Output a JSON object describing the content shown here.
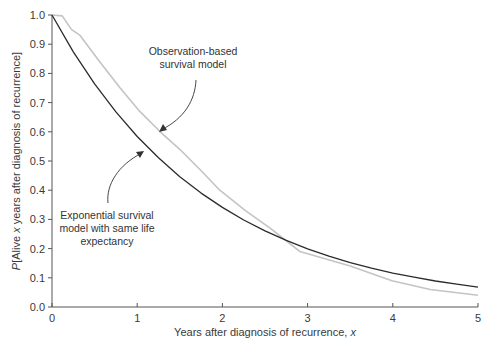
{
  "chart_data": {
    "type": "line",
    "title": "",
    "xlabel": "Years after diagnosis of recurrence, x",
    "ylabel": "P[Alive x years after diagnosis of recurrence]",
    "xlim": [
      0,
      5
    ],
    "ylim": [
      0,
      1.0
    ],
    "xticks": [
      "0",
      "1",
      "2",
      "3",
      "4",
      "5"
    ],
    "yticks": [
      "0.0",
      "0.1",
      "0.2",
      "0.3",
      "0.4",
      "0.5",
      "0.6",
      "0.7",
      "0.8",
      "0.9",
      "1.0"
    ],
    "grid": false,
    "legend": null,
    "series": [
      {
        "name": "Observation-based survival model",
        "color": "#c4c4c4",
        "x": [
          0,
          0.12,
          0.23,
          0.33,
          0.56,
          0.8,
          1.03,
          1.27,
          1.5,
          1.74,
          1.97,
          2.27,
          2.56,
          2.91,
          3.5,
          3.99,
          4.44,
          5.0
        ],
        "y": [
          1.0,
          0.997,
          0.95,
          0.93,
          0.84,
          0.75,
          0.67,
          0.6,
          0.54,
          0.47,
          0.4,
          0.33,
          0.27,
          0.19,
          0.14,
          0.09,
          0.06,
          0.04
        ]
      },
      {
        "name": "Exponential survival model with same life expectancy",
        "color": "#2b2b2b",
        "x": [
          0,
          0.25,
          0.5,
          0.75,
          1.0,
          1.25,
          1.5,
          1.75,
          2.0,
          2.25,
          2.5,
          2.75,
          3.0,
          3.25,
          3.5,
          3.75,
          4.0,
          4.25,
          4.5,
          4.75,
          5.0
        ],
        "y": [
          1.0,
          0.874,
          0.764,
          0.668,
          0.584,
          0.511,
          0.446,
          0.39,
          0.341,
          0.298,
          0.261,
          0.228,
          0.199,
          0.174,
          0.152,
          0.133,
          0.116,
          0.102,
          0.089,
          0.078,
          0.068
        ]
      }
    ],
    "annotations": [
      {
        "lines": [
          "Observation-based",
          "survival model"
        ],
        "points_to": "Observation-based survival model"
      },
      {
        "lines": [
          "Exponential survival",
          "model with same life",
          "expectancy"
        ],
        "points_to": "Exponential survival model with same life expectancy"
      }
    ]
  },
  "annotations": {
    "observation": [
      "Observation-based",
      "survival model"
    ],
    "exponential": [
      "Exponential survival",
      "model with same life",
      "expectancy"
    ]
  },
  "axes": {
    "xlabel_prefix": "Years after diagnosis of recurrence, ",
    "xlabel_var": "x",
    "ylabel_p": "P",
    "ylabel_pre": "[Alive ",
    "ylabel_var": "x",
    "ylabel_post": " years after diagnosis of recurrence]"
  }
}
